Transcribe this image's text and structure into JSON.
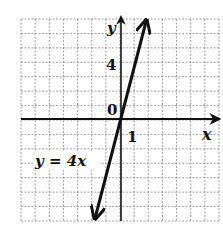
{
  "figure": {
    "type": "coordinate-graph",
    "grid": {
      "cols": 14,
      "rows": 14,
      "x_min": -7,
      "x_max": 7,
      "y_min": -7,
      "y_max": 7,
      "unit": 1
    },
    "axes": {
      "x_label": "x",
      "y_label": "y",
      "origin_label": "0",
      "x_tick_label": "1",
      "y_tick_label": "4"
    },
    "line": {
      "equation_label": "y = 4x",
      "slope": 4,
      "intercept": 0,
      "x_from": -1.85,
      "x_to": 1.8,
      "arrows": "both"
    },
    "colors": {
      "ink": "#111111",
      "grid": "#8a8a8a",
      "background": "#ffffff"
    }
  },
  "chart_data": {
    "type": "line",
    "title": "",
    "xlabel": "x",
    "ylabel": "y",
    "series": [
      {
        "name": "y = 4x",
        "x": [
          -1.75,
          -1,
          0,
          1,
          1.75
        ],
        "y": [
          -7,
          -4,
          0,
          4,
          7
        ]
      }
    ],
    "tick_labels": {
      "x": [
        "1"
      ],
      "y": [
        "0",
        "4"
      ]
    },
    "xlim": [
      -7,
      7
    ],
    "ylim": [
      -7,
      7
    ],
    "grid": true,
    "legend": "none",
    "annotations": [
      "y = 4x"
    ]
  }
}
